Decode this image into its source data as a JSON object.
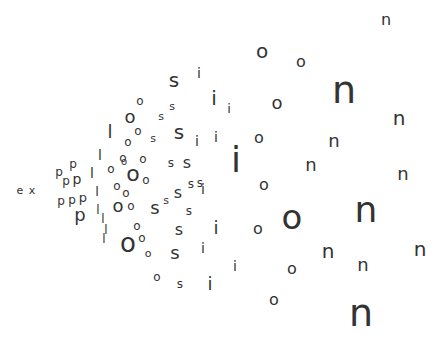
{
  "word": "explosion",
  "color": "#333333",
  "letters": [
    {
      "c": "e",
      "x": 20,
      "y": 190,
      "s": 11
    },
    {
      "c": "x",
      "x": 32,
      "y": 190,
      "s": 11
    },
    {
      "c": "p",
      "x": 73,
      "y": 164,
      "s": 12
    },
    {
      "c": "p",
      "x": 59,
      "y": 172,
      "s": 12
    },
    {
      "c": "p",
      "x": 66,
      "y": 181,
      "s": 12
    },
    {
      "c": "p",
      "x": 77,
      "y": 179,
      "s": 14
    },
    {
      "c": "p",
      "x": 61,
      "y": 201,
      "s": 12
    },
    {
      "c": "p",
      "x": 72,
      "y": 200,
      "s": 12
    },
    {
      "c": "p",
      "x": 83,
      "y": 197,
      "s": 13
    },
    {
      "c": "p",
      "x": 80,
      "y": 215,
      "s": 18
    },
    {
      "c": "l",
      "x": 100,
      "y": 155,
      "s": 14
    },
    {
      "c": "l",
      "x": 92,
      "y": 173,
      "s": 14
    },
    {
      "c": "l",
      "x": 97,
      "y": 191,
      "s": 13
    },
    {
      "c": "l",
      "x": 98,
      "y": 210,
      "s": 12
    },
    {
      "c": "l",
      "x": 106,
      "y": 230,
      "s": 12
    },
    {
      "c": "l",
      "x": 110,
      "y": 132,
      "s": 18
    },
    {
      "c": "l",
      "x": 103,
      "y": 219,
      "s": 12
    },
    {
      "c": "l",
      "x": 104,
      "y": 239,
      "s": 12
    },
    {
      "c": "o",
      "x": 140,
      "y": 101,
      "s": 12
    },
    {
      "c": "o",
      "x": 130,
      "y": 117,
      "s": 18
    },
    {
      "c": "o",
      "x": 138,
      "y": 131,
      "s": 12
    },
    {
      "c": "o",
      "x": 128,
      "y": 142,
      "s": 12
    },
    {
      "c": "o",
      "x": 123,
      "y": 158,
      "s": 12
    },
    {
      "c": "o",
      "x": 111,
      "y": 169,
      "s": 12
    },
    {
      "c": "o",
      "x": 124,
      "y": 162,
      "s": 10
    },
    {
      "c": "o",
      "x": 133,
      "y": 174,
      "s": 22
    },
    {
      "c": "o",
      "x": 146,
      "y": 180,
      "s": 12
    },
    {
      "c": "o",
      "x": 117,
      "y": 186,
      "s": 12
    },
    {
      "c": "o",
      "x": 126,
      "y": 193,
      "s": 12
    },
    {
      "c": "o",
      "x": 118,
      "y": 206,
      "s": 18
    },
    {
      "c": "o",
      "x": 131,
      "y": 206,
      "s": 12
    },
    {
      "c": "o",
      "x": 137,
      "y": 226,
      "s": 12
    },
    {
      "c": "o",
      "x": 128,
      "y": 243,
      "s": 26
    },
    {
      "c": "o",
      "x": 142,
      "y": 238,
      "s": 12
    },
    {
      "c": "o",
      "x": 148,
      "y": 253,
      "s": 11
    },
    {
      "c": "o",
      "x": 157,
      "y": 277,
      "s": 12
    },
    {
      "c": "o",
      "x": 143,
      "y": 159,
      "s": 12
    },
    {
      "c": "s",
      "x": 174,
      "y": 80,
      "s": 20
    },
    {
      "c": "s",
      "x": 172,
      "y": 106,
      "s": 11
    },
    {
      "c": "s",
      "x": 161,
      "y": 116,
      "s": 11
    },
    {
      "c": "s",
      "x": 179,
      "y": 132,
      "s": 20
    },
    {
      "c": "s",
      "x": 153,
      "y": 138,
      "s": 11
    },
    {
      "c": "s",
      "x": 171,
      "y": 163,
      "s": 12
    },
    {
      "c": "s",
      "x": 187,
      "y": 163,
      "s": 16
    },
    {
      "c": "s",
      "x": 178,
      "y": 193,
      "s": 16
    },
    {
      "c": "s",
      "x": 191,
      "y": 184,
      "s": 12
    },
    {
      "c": "s",
      "x": 200,
      "y": 183,
      "s": 12
    },
    {
      "c": "s",
      "x": 155,
      "y": 208,
      "s": 18
    },
    {
      "c": "s",
      "x": 166,
      "y": 200,
      "s": 11
    },
    {
      "c": "s",
      "x": 189,
      "y": 211,
      "s": 12
    },
    {
      "c": "s",
      "x": 179,
      "y": 230,
      "s": 16
    },
    {
      "c": "s",
      "x": 175,
      "y": 253,
      "s": 18
    },
    {
      "c": "s",
      "x": 180,
      "y": 284,
      "s": 12
    },
    {
      "c": "i",
      "x": 199,
      "y": 73,
      "s": 14
    },
    {
      "c": "i",
      "x": 214,
      "y": 98,
      "s": 20
    },
    {
      "c": "i",
      "x": 229,
      "y": 108,
      "s": 13
    },
    {
      "c": "i",
      "x": 197,
      "y": 141,
      "s": 14
    },
    {
      "c": "i",
      "x": 216,
      "y": 137,
      "s": 14
    },
    {
      "c": "i",
      "x": 236,
      "y": 160,
      "s": 36
    },
    {
      "c": "i",
      "x": 203,
      "y": 189,
      "s": 14
    },
    {
      "c": "i",
      "x": 216,
      "y": 228,
      "s": 18
    },
    {
      "c": "i",
      "x": 203,
      "y": 248,
      "s": 14
    },
    {
      "c": "i",
      "x": 235,
      "y": 266,
      "s": 14
    },
    {
      "c": "i",
      "x": 210,
      "y": 284,
      "s": 18
    },
    {
      "c": "o",
      "x": 262,
      "y": 51,
      "s": 20
    },
    {
      "c": "o",
      "x": 301,
      "y": 62,
      "s": 16
    },
    {
      "c": "o",
      "x": 277,
      "y": 103,
      "s": 18
    },
    {
      "c": "o",
      "x": 259,
      "y": 138,
      "s": 16
    },
    {
      "c": "o",
      "x": 264,
      "y": 185,
      "s": 16
    },
    {
      "c": "o",
      "x": 292,
      "y": 217,
      "s": 34
    },
    {
      "c": "o",
      "x": 258,
      "y": 229,
      "s": 16
    },
    {
      "c": "o",
      "x": 292,
      "y": 269,
      "s": 16
    },
    {
      "c": "o",
      "x": 274,
      "y": 300,
      "s": 16
    },
    {
      "c": "n",
      "x": 386,
      "y": 20,
      "s": 16
    },
    {
      "c": "n",
      "x": 344,
      "y": 90,
      "s": 38
    },
    {
      "c": "n",
      "x": 399,
      "y": 118,
      "s": 20
    },
    {
      "c": "n",
      "x": 334,
      "y": 141,
      "s": 18
    },
    {
      "c": "n",
      "x": 311,
      "y": 165,
      "s": 18
    },
    {
      "c": "n",
      "x": 403,
      "y": 174,
      "s": 18
    },
    {
      "c": "n",
      "x": 366,
      "y": 210,
      "s": 36
    },
    {
      "c": "n",
      "x": 328,
      "y": 251,
      "s": 20
    },
    {
      "c": "n",
      "x": 420,
      "y": 249,
      "s": 20
    },
    {
      "c": "n",
      "x": 363,
      "y": 265,
      "s": 18
    },
    {
      "c": "n",
      "x": 361,
      "y": 313,
      "s": 38
    }
  ]
}
